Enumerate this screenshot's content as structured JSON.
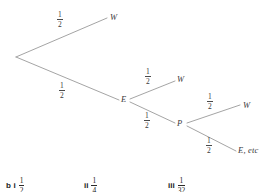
{
  "diagram": {
    "type": "probability-tree",
    "line_color": "#9a9a9a",
    "text_color": "#3a3a3a",
    "background": "#ffffff",
    "root": {
      "name": "start-node",
      "x": 16,
      "y": 57
    },
    "nodes": [
      {
        "id": "w1",
        "label": "W",
        "x": 113,
        "y": 19,
        "level": 1
      },
      {
        "id": "e1",
        "label": "E",
        "x": 124,
        "y": 100,
        "level": 1
      },
      {
        "id": "w2",
        "label": "W",
        "x": 180,
        "y": 81,
        "level": 2
      },
      {
        "id": "p1",
        "label": "P",
        "x": 180,
        "y": 124,
        "level": 2
      },
      {
        "id": "w3",
        "label": "W",
        "x": 246,
        "y": 106,
        "level": 3
      },
      {
        "id": "eetc",
        "label": "E, etc",
        "x": 241,
        "y": 152,
        "level": 3
      }
    ],
    "branches": [
      {
        "id": "b1",
        "from": "root",
        "to": "w1",
        "probability": "1/2",
        "num": "1",
        "den": "2"
      },
      {
        "id": "b2",
        "from": "root",
        "to": "e1",
        "probability": "1/2",
        "num": "1",
        "den": "2"
      },
      {
        "id": "b3",
        "from": "e1",
        "to": "w2",
        "probability": "1/2",
        "num": "1",
        "den": "2"
      },
      {
        "id": "b4",
        "from": "e1",
        "to": "p1",
        "probability": "1/2",
        "num": "1",
        "den": "2"
      },
      {
        "id": "b5",
        "from": "p1",
        "to": "w3",
        "probability": "1/2",
        "num": "1",
        "den": "2"
      },
      {
        "id": "b6",
        "from": "p1",
        "to": "eetc",
        "probability": "1/2",
        "num": "1",
        "den": "2"
      }
    ]
  },
  "answers": {
    "part_label": "b",
    "items": [
      {
        "roman": "i",
        "num": "1",
        "den": "2",
        "value": "1/2"
      },
      {
        "roman": "ii",
        "num": "1",
        "den": "4",
        "value": "1/4"
      },
      {
        "roman": "iii",
        "num": "1",
        "den": "32",
        "value": "1/32"
      }
    ]
  }
}
